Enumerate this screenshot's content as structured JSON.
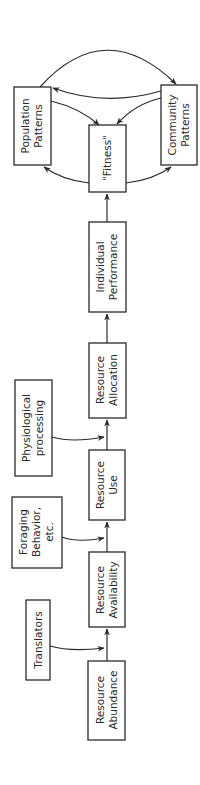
{
  "diagram": {
    "orientation": "rotated-90-ccw",
    "colors": {
      "ink": "#2a2a2a",
      "background": "#ffffff"
    },
    "nodes": [
      {
        "id": "resource-abundance",
        "lines": [
          "Resource",
          "Abundance"
        ]
      },
      {
        "id": "translators",
        "lines": [
          "Translators"
        ]
      },
      {
        "id": "resource-availability",
        "lines": [
          "Resource",
          "Availability"
        ]
      },
      {
        "id": "foraging-behavior",
        "lines": [
          "Foraging",
          "Behavior,",
          "etc."
        ]
      },
      {
        "id": "resource-use",
        "lines": [
          "Resource",
          "Use"
        ]
      },
      {
        "id": "physiological-processing",
        "lines": [
          "Physiological",
          "processing"
        ]
      },
      {
        "id": "resource-allocation",
        "lines": [
          "Resource",
          "Allocation"
        ]
      },
      {
        "id": "individual-performance",
        "lines": [
          "Individual",
          "Performance"
        ]
      },
      {
        "id": "fitness",
        "lines": [
          "\"Fitness\""
        ]
      },
      {
        "id": "population-patterns",
        "lines": [
          "Population",
          "Patterns"
        ]
      },
      {
        "id": "community-patterns",
        "lines": [
          "Community",
          "Patterns"
        ]
      }
    ],
    "edges": [
      {
        "from": "resource-abundance",
        "to": "resource-availability"
      },
      {
        "from": "translators",
        "to": "resource-abundance->resource-availability"
      },
      {
        "from": "resource-availability",
        "to": "resource-use"
      },
      {
        "from": "foraging-behavior",
        "to": "resource-availability->resource-use"
      },
      {
        "from": "resource-use",
        "to": "resource-allocation"
      },
      {
        "from": "physiological-processing",
        "to": "resource-use->resource-allocation"
      },
      {
        "from": "resource-allocation",
        "to": "individual-performance"
      },
      {
        "from": "individual-performance",
        "to": "fitness"
      },
      {
        "from": "fitness",
        "to": "population-patterns"
      },
      {
        "from": "fitness",
        "to": "community-patterns"
      },
      {
        "from": "population-patterns",
        "to": "fitness"
      },
      {
        "from": "community-patterns",
        "to": "fitness"
      },
      {
        "from": "population-patterns",
        "to": "community-patterns"
      },
      {
        "from": "community-patterns",
        "to": "population-patterns"
      }
    ]
  }
}
